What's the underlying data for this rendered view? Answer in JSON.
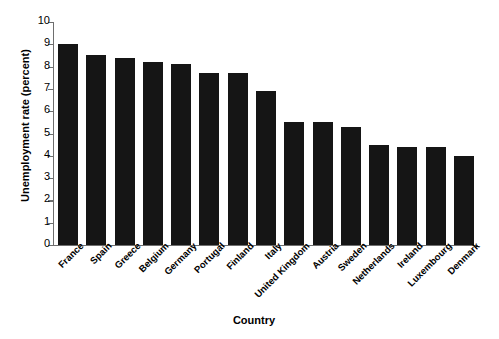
{
  "chart_data": {
    "type": "bar",
    "title": "",
    "xlabel": "Country",
    "ylabel": "Unemployment rate (percent)",
    "categories": [
      "France",
      "Spain",
      "Greece",
      "Belgium",
      "Germany",
      "Portugal",
      "Finland",
      "Italy",
      "United Kingdom",
      "Austria",
      "Sweden",
      "Netherlands",
      "Ireland",
      "Luxembourg",
      "Denmark"
    ],
    "values": [
      9.0,
      8.5,
      8.4,
      8.2,
      8.1,
      7.7,
      7.7,
      6.9,
      5.5,
      5.5,
      5.3,
      4.5,
      4.4,
      4.4,
      4.0
    ],
    "ylim": [
      0,
      10
    ],
    "yticks": [
      0,
      1,
      2,
      3,
      4,
      5,
      6,
      7,
      8,
      9,
      10
    ],
    "ytick_labels": [
      "0",
      "1",
      "2",
      "3",
      "4",
      "5",
      "6",
      "7",
      "8",
      "9",
      "10"
    ],
    "grid": false,
    "legend": null,
    "bar_color": "#151515",
    "axis_color": "#6e6e6e"
  }
}
